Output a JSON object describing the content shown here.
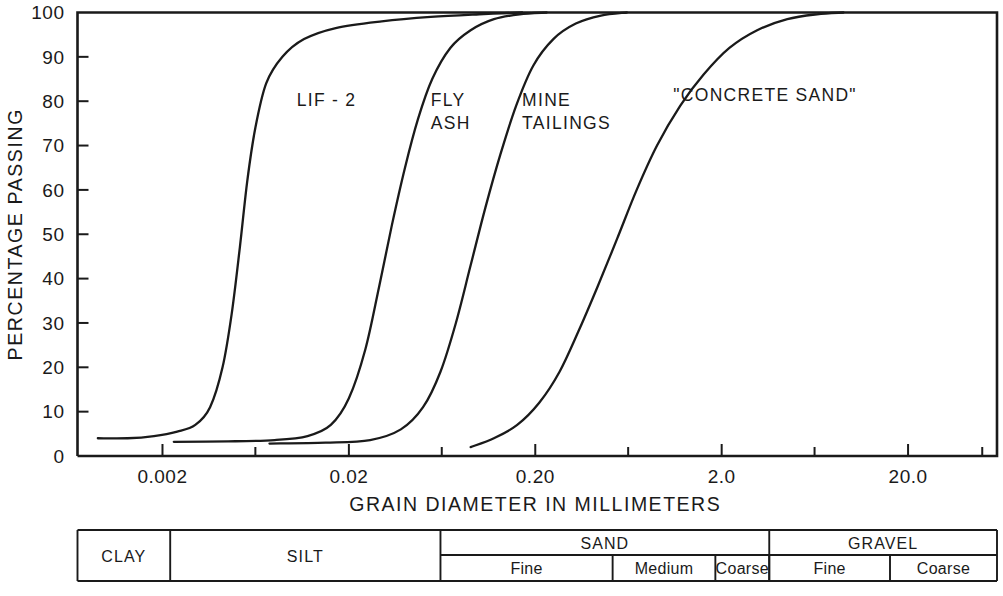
{
  "chart_data": {
    "type": "line",
    "title": "",
    "xlabel": "GRAIN DIAMETER IN MILLIMETERS",
    "ylabel": "PERCENTAGE PASSING",
    "x_scale": "log",
    "xlim": [
      0.0007,
      60.0
    ],
    "ylim": [
      0,
      100
    ],
    "grid": false,
    "legend": "inline-annotations",
    "x_tick_labels": [
      "0.002",
      "0.02",
      "0.20",
      "2.0",
      "20.0"
    ],
    "x_tick_values": [
      0.002,
      0.02,
      0.2,
      2.0,
      20.0
    ],
    "x_minor_tick_values": [
      0.0063,
      0.063,
      0.63,
      6.3,
      50.0
    ],
    "y_tick_labels": [
      "0",
      "10",
      "20",
      "30",
      "40",
      "50",
      "60",
      "70",
      "80",
      "90",
      "100"
    ],
    "y_tick_values": [
      0,
      10,
      20,
      30,
      40,
      50,
      60,
      70,
      80,
      90,
      100
    ],
    "series": [
      {
        "name": "LIF - 2",
        "points": [
          [
            0.0009,
            4
          ],
          [
            0.0013,
            4
          ],
          [
            0.0018,
            4.5
          ],
          [
            0.0024,
            5.5
          ],
          [
            0.003,
            7
          ],
          [
            0.0036,
            11
          ],
          [
            0.0042,
            20
          ],
          [
            0.0047,
            32
          ],
          [
            0.0052,
            47
          ],
          [
            0.0057,
            62
          ],
          [
            0.0063,
            74
          ],
          [
            0.0072,
            84
          ],
          [
            0.0088,
            90
          ],
          [
            0.0115,
            94
          ],
          [
            0.017,
            96.5
          ],
          [
            0.03,
            98
          ],
          [
            0.055,
            99
          ],
          [
            0.1,
            99.6
          ],
          [
            0.17,
            100
          ]
        ]
      },
      {
        "name": "FLY ASH",
        "points": [
          [
            0.0023,
            3.2
          ],
          [
            0.0045,
            3.3
          ],
          [
            0.008,
            3.6
          ],
          [
            0.012,
            4.5
          ],
          [
            0.016,
            7
          ],
          [
            0.02,
            13
          ],
          [
            0.0245,
            24
          ],
          [
            0.029,
            38
          ],
          [
            0.034,
            52
          ],
          [
            0.04,
            65
          ],
          [
            0.047,
            76
          ],
          [
            0.056,
            85
          ],
          [
            0.07,
            92
          ],
          [
            0.09,
            96
          ],
          [
            0.12,
            98.5
          ],
          [
            0.165,
            99.6
          ],
          [
            0.23,
            100
          ]
        ]
      },
      {
        "name": "MINE TAILINGS",
        "points": [
          [
            0.0075,
            2.8
          ],
          [
            0.015,
            3.0
          ],
          [
            0.026,
            3.6
          ],
          [
            0.038,
            6
          ],
          [
            0.05,
            11
          ],
          [
            0.062,
            19
          ],
          [
            0.075,
            30
          ],
          [
            0.09,
            43
          ],
          [
            0.108,
            56
          ],
          [
            0.13,
            68
          ],
          [
            0.158,
            79
          ],
          [
            0.195,
            88
          ],
          [
            0.25,
            94
          ],
          [
            0.33,
            97.5
          ],
          [
            0.45,
            99.3
          ],
          [
            0.62,
            100
          ]
        ]
      },
      {
        "name": "\"CONCRETE SAND\"",
        "points": [
          [
            0.09,
            2
          ],
          [
            0.12,
            4
          ],
          [
            0.16,
            7
          ],
          [
            0.21,
            12
          ],
          [
            0.27,
            19
          ],
          [
            0.34,
            28
          ],
          [
            0.43,
            38
          ],
          [
            0.55,
            49
          ],
          [
            0.7,
            60
          ],
          [
            0.9,
            70
          ],
          [
            1.2,
            79
          ],
          [
            1.6,
            86
          ],
          [
            2.2,
            92
          ],
          [
            3.1,
            96
          ],
          [
            4.5,
            98.5
          ],
          [
            6.5,
            99.6
          ],
          [
            9.0,
            100
          ]
        ]
      }
    ],
    "annotations": [
      {
        "text": "LIF - 2",
        "x": 0.0105,
        "y": 79
      },
      {
        "text": "FLY ASH",
        "lines": [
          "FLY",
          "ASH"
        ],
        "x": 0.055,
        "y": 79
      },
      {
        "text": "MINE TAILINGS",
        "lines": [
          "MINE",
          "TAILINGS"
        ],
        "x": 0.17,
        "y": 79
      },
      {
        "text": "\"CONCRETE SAND\"",
        "x": 1.1,
        "y": 80
      }
    ]
  },
  "classification_table": {
    "row_major": [
      {
        "label": "CLAY",
        "start": 0.0007,
        "end": 0.0022,
        "full_height": true
      },
      {
        "label": "SILT",
        "start": 0.0022,
        "end": 0.062,
        "full_height": true
      },
      {
        "label": "SAND",
        "start": 0.062,
        "end": 3.6,
        "full_height": false
      },
      {
        "label": "GRAVEL",
        "start": 3.6,
        "end": 60.0,
        "full_height": false
      }
    ],
    "row_minor": [
      {
        "label": "Fine",
        "parent": "SAND",
        "start": 0.062,
        "end": 0.52
      },
      {
        "label": "Medium",
        "parent": "SAND",
        "start": 0.52,
        "end": 1.85
      },
      {
        "label": "Coarse",
        "parent": "SAND",
        "start": 1.85,
        "end": 3.6
      },
      {
        "label": "Fine",
        "parent": "GRAVEL",
        "start": 3.6,
        "end": 16.0
      },
      {
        "label": "Coarse",
        "parent": "GRAVEL",
        "start": 16.0,
        "end": 60.0
      }
    ]
  },
  "colors": {
    "ink": "#1a1a1a",
    "background": "#ffffff"
  }
}
